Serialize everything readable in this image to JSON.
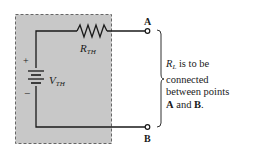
{
  "diagram": {
    "type": "thevenin-equivalent-circuit",
    "colors": {
      "box_fill": "#c8c8c8",
      "box_border": "#666666",
      "wire": "#1a1a1a"
    },
    "resistor": {
      "label_main": "R",
      "label_sub": "TH"
    },
    "source": {
      "label_main": "V",
      "label_sub": "TH",
      "plus": "+",
      "minus": "−"
    },
    "terminals": {
      "a": "A",
      "b": "B"
    },
    "note": {
      "rl_main": "R",
      "rl_sub": "L",
      "line1_rest": " is to be",
      "line2": "connected",
      "line3": "between points",
      "a": "A",
      "and": " and ",
      "b": "B",
      "end": "."
    }
  }
}
